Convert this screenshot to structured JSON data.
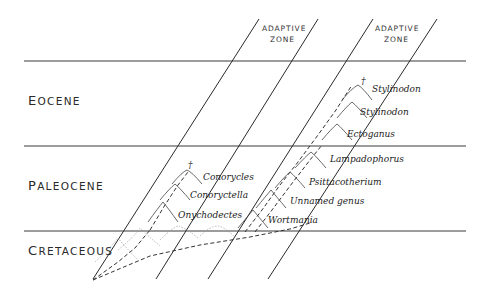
{
  "diagram": {
    "zones": [
      {
        "label_line1": "ADAPTIVE",
        "label_line2": "ZONE"
      },
      {
        "label_line1": "ADAPTIVE",
        "label_line2": "ZONE"
      }
    ],
    "epochs": [
      {
        "cap": "E",
        "rest": "OCENE"
      },
      {
        "cap": "P",
        "rest": "ALEOCENE"
      },
      {
        "cap": "C",
        "rest": "RETACEOUS"
      }
    ],
    "lineage_left": {
      "taxa": [
        "Conorycles",
        "Conoryctella",
        "Onychodectes"
      ],
      "extinct_marker": "†"
    },
    "lineage_right": {
      "taxa": [
        "Stylinodon",
        "Stylinodon",
        "Ectoganus",
        "Lampadophorus",
        "Psittacotherium",
        "Unnamed genus",
        "Wortmania"
      ],
      "extinct_marker": "†"
    }
  }
}
